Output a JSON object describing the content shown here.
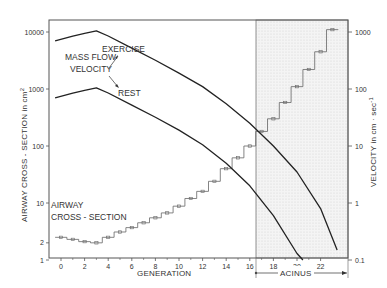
{
  "chart_data": {
    "type": "line",
    "title": "",
    "xlabel": "GENERATION",
    "ylabel_left": "AIRWAY CROSS - SECTION  in  cm²",
    "ylabel_right": "VELOCITY  in  cm · sec⁻¹",
    "x_ticks": [
      0,
      2,
      4,
      6,
      8,
      10,
      12,
      14,
      16,
      18,
      20,
      22
    ],
    "y_left_ticks": [
      "1",
      "2",
      "10",
      "100",
      "1000",
      "10000"
    ],
    "y_left_range": [
      1,
      20000
    ],
    "y_right_ticks": [
      "0.1",
      "1",
      "10",
      "100",
      "1000"
    ],
    "y_right_range": [
      0.1,
      2000
    ],
    "y_scale": "log",
    "grid": false,
    "region": {
      "label": "ACINUS",
      "from_generation": 16.6,
      "to_generation": 23.5,
      "shaded": true
    },
    "annotations": [
      "MASS FLOW VELOCITY",
      "EXERCISE",
      "REST",
      "AIRWAY CROSS - SECTION"
    ],
    "series": [
      {
        "name": "AIRWAY CROSS - SECTION",
        "axis": "left",
        "style": "step with markers",
        "generation": [
          0,
          1,
          2,
          3,
          4,
          5,
          6,
          7,
          8,
          9,
          10,
          11,
          12,
          13,
          14,
          15,
          16,
          17,
          18,
          19,
          20,
          21,
          22,
          23
        ],
        "values": [
          2.5,
          2.3,
          2.1,
          2.0,
          2.5,
          3.1,
          3.7,
          4.5,
          5.5,
          6.7,
          8.8,
          12,
          16,
          24,
          40,
          62,
          100,
          180,
          300,
          580,
          1100,
          2200,
          4500,
          11000
        ]
      },
      {
        "name": "EXERCISE",
        "axis": "right",
        "style": "line",
        "generation": [
          -0.5,
          1,
          2,
          3,
          4,
          6,
          8,
          10,
          12,
          14,
          16,
          18,
          20,
          22,
          23.4
        ],
        "values": [
          700,
          850,
          950,
          1050,
          850,
          520,
          320,
          190,
          110,
          55,
          25,
          10,
          3.5,
          0.8,
          0.15
        ]
      },
      {
        "name": "REST",
        "axis": "right",
        "style": "line",
        "generation": [
          -0.5,
          1,
          2,
          3,
          4,
          6,
          8,
          10,
          12,
          14,
          16,
          18,
          20,
          20.5
        ],
        "values": [
          70,
          85,
          95,
          105,
          85,
          52,
          32,
          19,
          10.5,
          5,
          2,
          0.6,
          0.13,
          0.1
        ]
      }
    ]
  },
  "labels": {
    "mass_flow_1": "MASS FLOW",
    "mass_flow_2": "VELOCITY",
    "exercise": "EXERCISE",
    "rest": "REST",
    "airway_1": "AIRWAY",
    "airway_2": "CROSS - SECTION",
    "xlabel": "GENERATION",
    "acinus": "ACINUS",
    "ylabel_left": "AIRWAY CROSS - SECTION  in  cm",
    "ylabel_left_sup": "2",
    "ylabel_right": "VELOCITY  in  cm · sec",
    "ylabel_right_sup": "-1"
  }
}
